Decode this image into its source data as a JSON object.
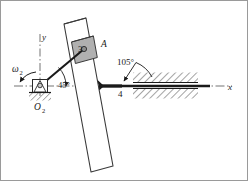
{
  "figure": {
    "type": "kinematic-mechanism-diagram",
    "background_color": "#ffffff",
    "line_color": "#1a1a1a",
    "block_fill_color": "#b0b0b0"
  },
  "axes": {
    "x_label": "x",
    "y_label": "y",
    "x_axis_style": "dash-dot",
    "y_axis_style": "dash-dot"
  },
  "labels": {
    "omega2": "ω",
    "omega2_sub": "2",
    "angle_crank": "45°",
    "angle_bar": "105°",
    "point_a": "A",
    "link3": "3",
    "link4": "4",
    "pivot_o2": "O",
    "pivot_o2_sub": "2"
  },
  "geometry": {
    "pivot_o2": {
      "x": 40,
      "y": 86
    },
    "point_a": {
      "x": 82,
      "y": 50
    },
    "joint_4": {
      "x": 123,
      "y": 86
    },
    "crank_angle_deg": 45,
    "bar_angle_deg": 105,
    "ground_line_y": 86
  },
  "hatching": {
    "pivot_ground": "diagonal",
    "slot_upper": "diagonal",
    "slot_lower": "diagonal"
  }
}
